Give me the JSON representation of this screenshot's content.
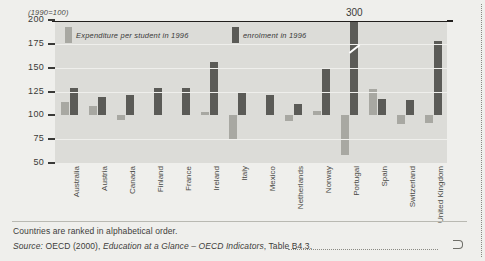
{
  "figure": {
    "unit_note": "(1990=100)",
    "legend": [
      {
        "key": "expenditure",
        "label": "Expenditure per student in 1996",
        "color": "#a8a8a2"
      },
      {
        "key": "enrolment",
        "label": "enrolment in 1996",
        "color": "#5b5b57"
      }
    ],
    "portugal_value_label": "300"
  },
  "footer": {
    "note": "Countries are ranked in alphabetical order.",
    "source_prefix": "Source:",
    "source_body_1": " OECD (2000), ",
    "source_italic": "Education at a Glance – OECD Indicators",
    "source_body_2": ", Table B4.3."
  },
  "chart_data": {
    "type": "bar",
    "title": "",
    "xlabel": "",
    "ylabel": "(1990=100)",
    "ylim": [
      50,
      200
    ],
    "yticks": [
      50,
      75,
      100,
      125,
      150,
      175,
      200
    ],
    "grid": true,
    "baseline": 100,
    "legend_position": "top-inside",
    "categories": [
      "Australia",
      "Austria",
      "Canada",
      "Finland",
      "France",
      "Ireland",
      "Italy",
      "Mexico",
      "Netherlands",
      "Norway",
      "Portugal",
      "Spain",
      "Switzerland",
      "United Kingdom"
    ],
    "series": [
      {
        "name": "Expenditure per student in 1996",
        "color": "#a8a8a2",
        "values": [
          114,
          110,
          95,
          null,
          null,
          104,
          74,
          null,
          94,
          105,
          58,
          128,
          91,
          92
        ]
      },
      {
        "name": "enrolment in 1996",
        "color": "#5b5b57",
        "values": [
          129,
          119,
          121,
          129,
          129,
          156,
          125,
          121,
          112,
          150,
          300,
          117,
          116,
          178
        ]
      }
    ],
    "annotations": [
      {
        "category": "Portugal",
        "series": "enrolment in 1996",
        "text": "300",
        "note": "bar truncated with axis-break mark"
      }
    ]
  }
}
